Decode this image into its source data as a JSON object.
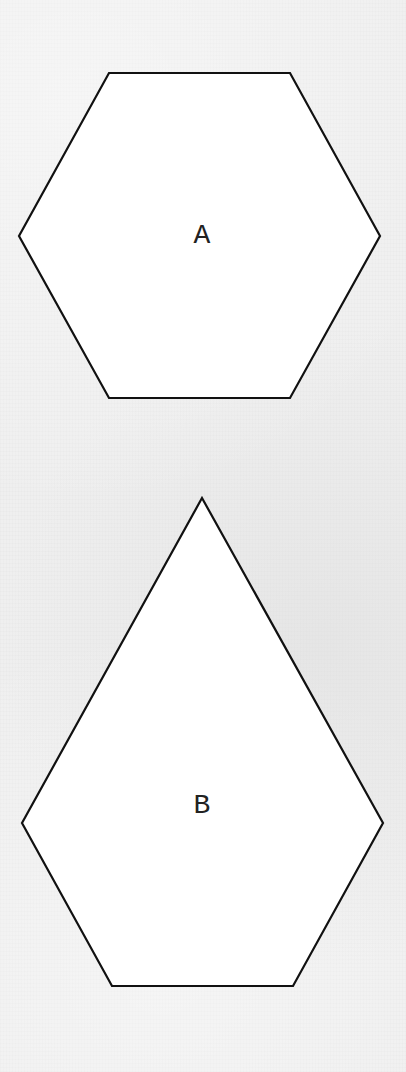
{
  "diagram": {
    "background_color": "#efefef",
    "shapes": [
      {
        "id": "A",
        "label": "A",
        "type": "regular-hexagon",
        "points": "109,73 290,73 380,236 290,398 109,398 19,236",
        "label_position": [
          202,
          236
        ],
        "fill": "#ffffff",
        "stroke": "#111111"
      },
      {
        "id": "B",
        "label": "B",
        "type": "pentagon",
        "points": "202,498 383,823 293,986 112,986 22,823",
        "label_position": [
          202,
          806
        ],
        "fill": "#ffffff",
        "stroke": "#111111"
      }
    ]
  }
}
